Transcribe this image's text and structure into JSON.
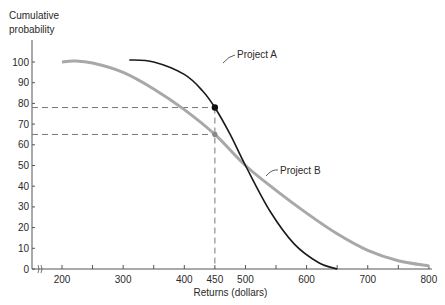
{
  "chart_data": {
    "type": "line",
    "title": "",
    "xlabel": "Returns (dollars)",
    "ylabel": "Cumulative probability",
    "xlim": [
      170,
      800
    ],
    "ylim": [
      0,
      100
    ],
    "x_ticks": [
      200,
      250,
      300,
      350,
      400,
      450,
      500,
      550,
      600,
      650,
      700,
      750,
      800
    ],
    "x_tick_labels": [
      "200",
      "300",
      "400",
      "450",
      "500",
      "600",
      "700",
      "800"
    ],
    "y_ticks": [
      0,
      10,
      20,
      30,
      40,
      50,
      60,
      70,
      80,
      90,
      100
    ],
    "y_tick_labels": [
      "0",
      "10",
      "20",
      "30",
      "40",
      "50",
      "60",
      "70",
      "80",
      "90",
      "100"
    ],
    "axis_break": "x-axis break between 0 and 200",
    "grid": false,
    "legend": "inline labels",
    "series": [
      {
        "name": "Project A",
        "color": "#1a1a1a",
        "x": [
          310,
          350,
          400,
          430,
          450,
          475,
          500,
          540,
          580,
          620,
          650
        ],
        "y": [
          101,
          100,
          94,
          86,
          78,
          65,
          50,
          28,
          12,
          3,
          0
        ]
      },
      {
        "name": "Project B",
        "color": "#a8a8a8",
        "x": [
          200,
          220,
          250,
          300,
          350,
          400,
          450,
          500,
          550,
          600,
          650,
          700,
          750,
          800
        ],
        "y": [
          100,
          100.5,
          99.5,
          95,
          87,
          77,
          65,
          50,
          38,
          27,
          17,
          9,
          4,
          1.5
        ]
      }
    ],
    "annotations": [
      {
        "type": "point",
        "series": "Project A",
        "x": 450,
        "y": 78
      },
      {
        "type": "point",
        "series": "Project B",
        "x": 450,
        "y": 65
      },
      {
        "type": "dashed-line",
        "from": [
          0,
          78
        ],
        "to": [
          450,
          78
        ]
      },
      {
        "type": "dashed-line",
        "from": [
          0,
          65
        ],
        "to": [
          450,
          65
        ]
      },
      {
        "type": "dashed-line",
        "from": [
          450,
          0
        ],
        "to": [
          450,
          78
        ]
      },
      {
        "type": "label",
        "text": "Project A",
        "near": [
          460,
          88
        ]
      },
      {
        "type": "label",
        "text": "Project B",
        "near": [
          560,
          44
        ]
      }
    ]
  },
  "labels": {
    "y_axis_line1": "Cumulative",
    "y_axis_line2": "probability",
    "x_axis": "Returns (dollars)",
    "project_a": "Project A",
    "project_b": "Project B"
  }
}
